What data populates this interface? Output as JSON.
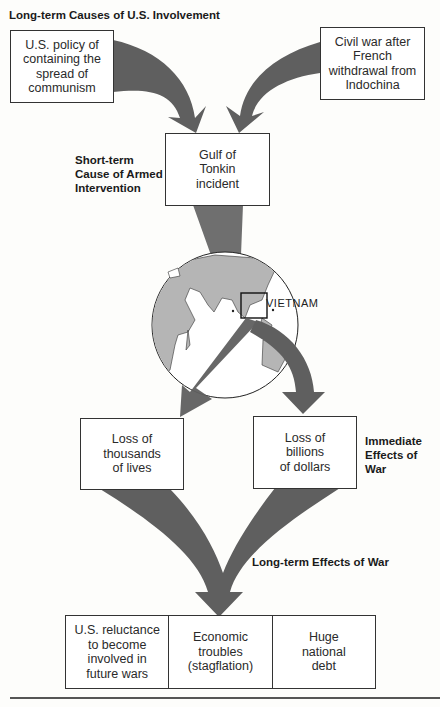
{
  "headings": {
    "long_term_causes": "Long-term Causes of U.S. Involvement",
    "short_term_cause": "Short-term\nCause of Armed\nIntervention",
    "immediate_effects": "Immediate\nEffects of\nWar",
    "long_term_effects": "Long-term Effects of War"
  },
  "long_term_causes": [
    {
      "text": "U.S. policy of\ncontaining the\nspread of\ncommunism"
    },
    {
      "text": "Civil war after\nFrench\nwithdrawal from\nIndochina"
    }
  ],
  "short_term_cause": {
    "text": "Gulf of\nTonkin\nincident"
  },
  "globe": {
    "label": "VIETNAM",
    "land_color": "#b5b5b5",
    "ocean_color": "#ffffff"
  },
  "immediate_effects": [
    {
      "text": "Loss of\nthousands\nof lives"
    },
    {
      "text": "Loss of\nbillions\nof dollars"
    }
  ],
  "long_term_effects": [
    {
      "text": "U.S. reluctance\nto become\ninvolved in\nfuture wars"
    },
    {
      "text": "Economic\ntroubles\n(stagflation)"
    },
    {
      "text": "Huge\nnational\ndebt"
    }
  ],
  "colors": {
    "arrow": "#5f5f5f",
    "box_border": "#333333",
    "background": "#fdfdfb"
  }
}
